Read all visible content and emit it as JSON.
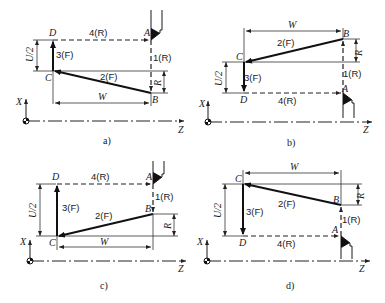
{
  "figure": {
    "type": "turning-cycle-tool-path-diagram",
    "subfigures": [
      {
        "caption": "a)",
        "points": {
          "A": "A",
          "B": "B",
          "C": "C",
          "D": "D"
        },
        "moves": {
          "m1": "1(R)",
          "m2": "2(F)",
          "m3": "3(F)",
          "m4": "4(R)"
        },
        "dims": {
          "u": "U/2",
          "w": "W",
          "r": "R"
        },
        "axes": {
          "x": "X",
          "z": "Z"
        }
      },
      {
        "caption": "b)",
        "points": {
          "A": "A",
          "B": "B",
          "C": "C",
          "D": "D"
        },
        "moves": {
          "m1": "1(R)",
          "m2": "2(F)",
          "m3": "3(F)",
          "m4": "4(R)"
        },
        "dims": {
          "u": "U/2",
          "w": "W",
          "r": "R"
        },
        "axes": {
          "x": "X",
          "z": "Z"
        }
      },
      {
        "caption": "c)",
        "points": {
          "A": "A",
          "B": "B",
          "C": "C",
          "D": "D"
        },
        "moves": {
          "m1": "1(R)",
          "m2": "2(F)",
          "m3": "3(F)",
          "m4": "4(R)"
        },
        "dims": {
          "u": "U/2",
          "w": "W",
          "r": "R"
        },
        "axes": {
          "x": "X",
          "z": "Z"
        }
      },
      {
        "caption": "d)",
        "points": {
          "A": "A",
          "B": "B",
          "C": "C",
          "D": "D"
        },
        "moves": {
          "m1": "1(R)",
          "m2": "2(F)",
          "m3": "3(F)",
          "m4": "4(R)"
        },
        "dims": {
          "u": "U/2",
          "w": "W",
          "r": "R"
        },
        "axes": {
          "x": "X",
          "z": "Z"
        }
      }
    ]
  }
}
